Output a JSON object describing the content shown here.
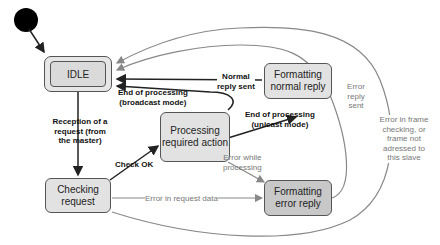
{
  "diagram": {
    "type": "state-machine",
    "initial_state": "IDLE",
    "states": {
      "idle": "IDLE",
      "checking": [
        "Checking",
        "request"
      ],
      "processing": [
        "Processing",
        "required action"
      ],
      "formatting_normal": [
        "Formatting",
        "normal reply"
      ],
      "formatting_error": [
        "Formatting",
        "error reply"
      ]
    },
    "transitions": {
      "reception": [
        "Reception of a",
        "request (from",
        "the master)"
      ],
      "check_ok": "Check OK",
      "error_request_data": "Error in request data",
      "end_broadcast": [
        "End of processing",
        "(broadcast mode)"
      ],
      "end_unicast": [
        "End of processing",
        "(unicast mode)"
      ],
      "normal_reply_sent": [
        "Normal",
        "reply sent"
      ],
      "error_while_processing": [
        "Error while",
        "processing"
      ],
      "error_reply_sent": [
        "Error",
        "reply",
        "sent"
      ],
      "error_frame": [
        "Error in frame",
        "checking, or",
        "frame not",
        "adressed to",
        "this slave"
      ]
    },
    "colors": {
      "node_fill": "#e2e2e2",
      "error_node_fill": "#c8c8c8",
      "bold_edge": "#222222",
      "gray_edge": "#888888"
    }
  }
}
